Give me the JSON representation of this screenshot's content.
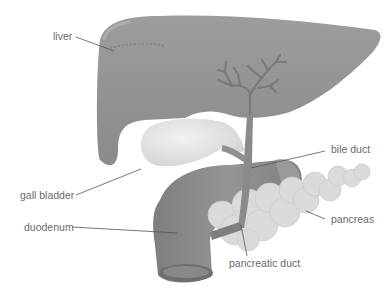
{
  "diagram": {
    "labels": {
      "liver": "liver",
      "bile_duct": "bile duct",
      "gall_bladder": "gall bladder",
      "duodenum": "duodenum",
      "pancreas": "pancreas",
      "pancreatic_duct": "pancreatic duct"
    },
    "colors": {
      "background": "#ffffff",
      "liver": "#8f8f8f",
      "liver_highlight": "#a8a8a8",
      "gall_bladder": "#e4e4e4",
      "duct": "#7c7c7c",
      "pancreas": "#d9d9d9",
      "duodenum": "#8a8a8a",
      "label_text": "#6a6a6a",
      "leader_line": "#555555"
    }
  }
}
